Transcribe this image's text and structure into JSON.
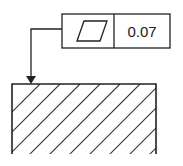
{
  "diagram": {
    "type": "gd&t-feature-control-frame",
    "frame": {
      "symbol": "flatness-icon",
      "symbol_name": "Flatness",
      "tolerance": "0.07"
    },
    "leader": {
      "style": "arrow"
    },
    "part": {
      "hatch": "diagonal section lines"
    },
    "colors": {
      "line": "#222222",
      "background": "#ffffff"
    }
  }
}
